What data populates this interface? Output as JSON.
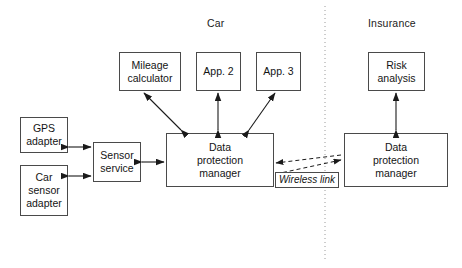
{
  "diagram": {
    "title_zones": [
      {
        "id": "car",
        "label": "Car"
      },
      {
        "id": "insurance",
        "label": "Insurance"
      }
    ],
    "nodes": [
      {
        "id": "gps-adapter",
        "label": "GPS adapter",
        "line1": "GPS",
        "line2": "adapter",
        "line3": ""
      },
      {
        "id": "car-sensor-adapter",
        "label": "Car sensor adapter",
        "line1": "Car",
        "line2": "sensor",
        "line3": "adapter"
      },
      {
        "id": "sensor-service",
        "label": "Sensor service",
        "line1": "Sensor",
        "line2": "service",
        "line3": ""
      },
      {
        "id": "mileage-calculator",
        "label": "Mileage calculator",
        "line1": "Mileage",
        "line2": "calculator",
        "line3": ""
      },
      {
        "id": "app-2",
        "label": "App. 2",
        "line1": "App. 2",
        "line2": "",
        "line3": ""
      },
      {
        "id": "app-3",
        "label": "App. 3",
        "line1": "App. 3",
        "line2": "",
        "line3": ""
      },
      {
        "id": "car-data-protection-manager",
        "label": "Data protection manager",
        "line1": "Data",
        "line2": "protection",
        "line3": "manager"
      },
      {
        "id": "risk-analysis",
        "label": "Risk analysis",
        "line1": "Risk",
        "line2": "analysis",
        "line3": ""
      },
      {
        "id": "insurance-data-protection-manager",
        "label": "Data protection manager",
        "line1": "Data",
        "line2": "protection",
        "line3": "manager"
      }
    ],
    "annotations": [
      {
        "id": "wireless-link",
        "label": "Wireless link"
      }
    ],
    "colors": {
      "box_border": "#4a4a4a",
      "edge": "#1a1a1a",
      "divider": "#9a9a9a",
      "background": "#ffffff",
      "text": "#141414"
    }
  }
}
